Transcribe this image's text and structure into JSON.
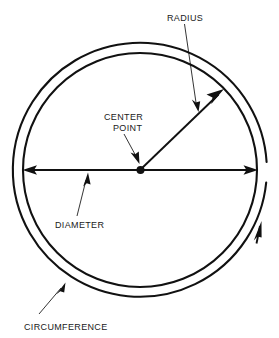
{
  "figure": {
    "background_color": "#ffffff",
    "ink_color": "#111111",
    "labels": {
      "radius": "RADIUS",
      "center_point_line1": "CENTER",
      "center_point_line2": "POINT",
      "diameter": "DIAMETER",
      "circumference": "CIRCUMFERENCE"
    },
    "geometry": {
      "center_x": 140,
      "center_y": 170,
      "inner_radius": 117,
      "outer_radius": 127,
      "diameter_left_x": 24,
      "diameter_right_x": 257,
      "diameter_y": 170,
      "radius_tip_x": 223,
      "radius_tip_y": 89
    }
  }
}
